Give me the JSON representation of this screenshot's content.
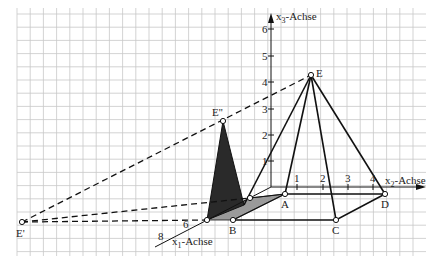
{
  "diagram": {
    "grid": {
      "x0": 17,
      "x1": 426,
      "y0": 8,
      "y1": 256,
      "step": 13.2,
      "color": "#c8c8c8"
    },
    "axes": {
      "x1": {
        "label_main": "x",
        "label_sub": "1",
        "label_rest": "-Achse",
        "from": [
          271,
          187
        ],
        "to": [
          155,
          247
        ],
        "ticks": [
          {
            "v": "6",
            "x": 183,
            "y": 228
          },
          {
            "v": "8",
            "x": 158,
            "y": 240
          }
        ]
      },
      "x2": {
        "label_main": "x",
        "label_sub": "2",
        "label_rest": "-Achse",
        "from": [
          271,
          187
        ],
        "to": [
          425,
          187
        ],
        "ticks": [
          {
            "v": "1",
            "x": 297
          },
          {
            "v": "2",
            "x": 323
          },
          {
            "v": "3",
            "x": 348
          },
          {
            "v": "4",
            "x": 373
          }
        ]
      },
      "x3": {
        "label_main": "x",
        "label_sub": "3",
        "label_rest": "-Achse",
        "from": [
          271,
          187
        ],
        "to": [
          271,
          14
        ],
        "ticks": [
          {
            "v": "1",
            "y": 161
          },
          {
            "v": "2",
            "y": 135
          },
          {
            "v": "3",
            "y": 109
          },
          {
            "v": "4",
            "y": 82
          },
          {
            "v": "5",
            "y": 56
          },
          {
            "v": "6",
            "y": 29
          }
        ]
      }
    },
    "points": {
      "A": {
        "label": "A",
        "x": 285,
        "y": 194
      },
      "B": {
        "label": "B",
        "x": 233,
        "y": 220
      },
      "C": {
        "label": "C",
        "x": 336,
        "y": 220
      },
      "D": {
        "label": "D",
        "x": 385,
        "y": 194
      },
      "E": {
        "label": "E",
        "x": 311,
        "y": 75
      },
      "E_prime": {
        "label": "E'",
        "x": 22,
        "y": 222
      },
      "E_dprime": {
        "label": "E''",
        "x": 223,
        "y": 121
      },
      "S1": {
        "label": "",
        "x": 207,
        "y": 220
      },
      "S2": {
        "label": "",
        "x": 250,
        "y": 198
      }
    },
    "colors": {
      "line": "#111111",
      "dark_shadow": "#2a2a2a",
      "light_shadow": "#9a9a9a",
      "grid": "#c8c8c8"
    }
  }
}
